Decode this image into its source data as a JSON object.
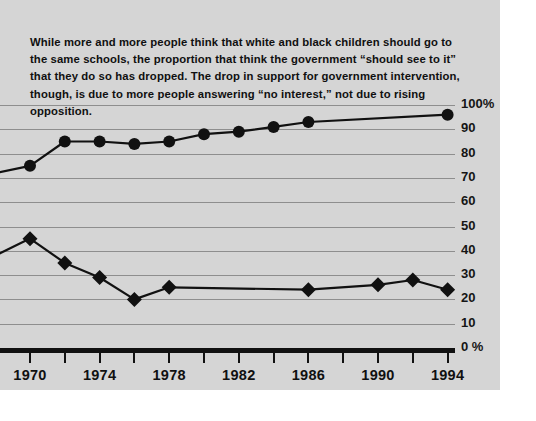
{
  "caption": {
    "text": "While more and more people think that white and black children should go to the same schools, the proportion that think the government “should see to it” that they do so has dropped. The drop in support for government intervention, though, is due to more people answering “no interest,” not due to rising opposition."
  },
  "colors": {
    "plate_background": "#d5d5d5",
    "gridline": "#8e8e8e",
    "axis": "#111111",
    "series_ink": "#111111",
    "text": "#101010"
  },
  "chart_data": {
    "type": "line",
    "title": "",
    "subtitle": "",
    "xlabel": "",
    "ylabel": "",
    "xlim": [
      1968,
      1996
    ],
    "ylim": [
      0,
      100
    ],
    "grid": true,
    "legend_position": "none",
    "x_tick_step": 2,
    "x_label_step": 4,
    "x_ticks": [
      1970,
      1972,
      1974,
      1976,
      1978,
      1980,
      1982,
      1984,
      1986,
      1988,
      1990,
      1992,
      1994
    ],
    "x_tick_labels": [
      "1970",
      "",
      "1974",
      "",
      "1978",
      "",
      "1982",
      "",
      "1986",
      "",
      "1990",
      "",
      "1994"
    ],
    "y_ticks": [
      0,
      10,
      20,
      30,
      40,
      50,
      60,
      70,
      80,
      90,
      100
    ],
    "y_tick_labels": [
      "0 %",
      "10",
      "20",
      "30",
      "40",
      "50",
      "60",
      "70",
      "80",
      "90",
      "100%"
    ],
    "series": [
      {
        "name": "Same schools: should go",
        "marker": "circle",
        "x": [
          1968,
          1970,
          1972,
          1974,
          1976,
          1978,
          1980,
          1982,
          1984,
          1986,
          1994
        ],
        "values": [
          72,
          75,
          85,
          85,
          84,
          85,
          88,
          89,
          91,
          93,
          96
        ],
        "clipped_left": true
      },
      {
        "name": "Government should see to it",
        "marker": "diamond",
        "x": [
          1968,
          1970,
          1972,
          1974,
          1976,
          1978,
          1986,
          1990,
          1992,
          1994
        ],
        "values": [
          38,
          45,
          35,
          29,
          20,
          25,
          24,
          26,
          28,
          24
        ],
        "clipped_left": true
      }
    ]
  }
}
